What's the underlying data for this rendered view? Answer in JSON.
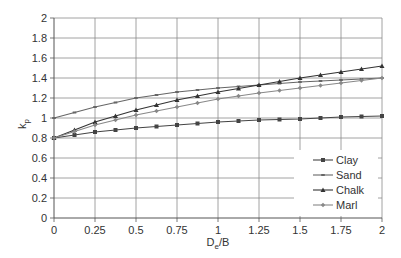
{
  "chart_data": {
    "type": "line",
    "title": "",
    "xlabel": "D_e/B",
    "ylabel": "k_p",
    "xlim": [
      0,
      2
    ],
    "ylim": [
      0,
      2
    ],
    "xticks": [
      "0",
      "0.25",
      "0.5",
      "0.75",
      "1",
      "1.25",
      "1.5",
      "1.75",
      "2"
    ],
    "yticks": [
      "0",
      "0.2",
      "0.4",
      "0.6",
      "0.8",
      "1",
      "1.2",
      "1.4",
      "1.6",
      "1.8",
      "2"
    ],
    "grid": true,
    "legend_position": "lower right",
    "x": [
      0,
      0.25,
      0.5,
      0.75,
      1,
      1.25,
      1.5,
      1.75,
      2
    ],
    "series": [
      {
        "name": "Clay",
        "color": "#444444",
        "marker": "square",
        "values": [
          0.8,
          0.86,
          0.9,
          0.93,
          0.96,
          0.98,
          0.99,
          1.01,
          1.02
        ]
      },
      {
        "name": "Sand",
        "color": "#666666",
        "marker": "dash",
        "values": [
          1.0,
          1.11,
          1.2,
          1.26,
          1.3,
          1.33,
          1.36,
          1.38,
          1.4
        ]
      },
      {
        "name": "Chalk",
        "color": "#333333",
        "marker": "triangle",
        "values": [
          0.8,
          0.96,
          1.08,
          1.18,
          1.26,
          1.33,
          1.4,
          1.46,
          1.52
        ]
      },
      {
        "name": "Marl",
        "color": "#888888",
        "marker": "diamond",
        "values": [
          0.8,
          0.93,
          1.03,
          1.11,
          1.19,
          1.25,
          1.3,
          1.35,
          1.4
        ]
      }
    ]
  },
  "labels": {
    "ylabel_main": "k",
    "ylabel_sub": "p",
    "xlabel_main": "D",
    "xlabel_sub": "e",
    "xlabel_rest": "/B"
  }
}
